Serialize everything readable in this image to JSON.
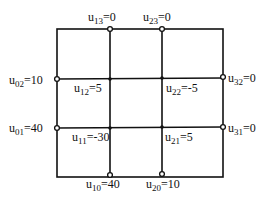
{
  "diagram": {
    "type": "finite-difference grid",
    "grid": {
      "columns": 3,
      "rows": 3
    },
    "boundary_nodes": [
      {
        "name": "u",
        "sub": "13",
        "value": "0"
      },
      {
        "name": "u",
        "sub": "23",
        "value": "0"
      },
      {
        "name": "u",
        "sub": "02",
        "value": "10"
      },
      {
        "name": "u",
        "sub": "32",
        "value": "0"
      },
      {
        "name": "u",
        "sub": "01",
        "value": "40"
      },
      {
        "name": "u",
        "sub": "31",
        "value": "0"
      },
      {
        "name": "u",
        "sub": "10",
        "value": "40"
      },
      {
        "name": "u",
        "sub": "20",
        "value": "10"
      }
    ],
    "interior_nodes": [
      {
        "name": "u",
        "sub": "12",
        "value": "5"
      },
      {
        "name": "u",
        "sub": "22",
        "value": "-5"
      },
      {
        "name": "u",
        "sub": "11",
        "value": "-30"
      },
      {
        "name": "u",
        "sub": "21",
        "value": "5"
      }
    ]
  }
}
